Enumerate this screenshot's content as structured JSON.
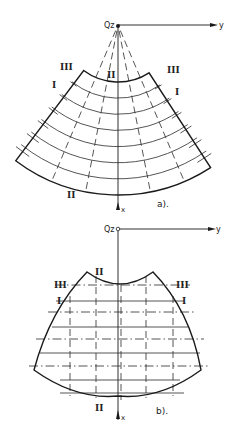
{
  "figures": [
    {
      "id": "a",
      "caption": "a).",
      "origin_label": "Qz",
      "y_axis_label": "y",
      "x_axis_label": "x",
      "section_labels": {
        "left_top": "III",
        "left_mid": "I",
        "top_center": "II",
        "right_top": "III",
        "right_mid": "I",
        "bottom": "II"
      },
      "description": "Annular sector (curved fan-shaped) cross-section with radial dashed lines converging at origin Qz and concentric arc lines"
    },
    {
      "id": "b",
      "caption": "b).",
      "origin_label": "Qz",
      "y_axis_label": "y",
      "x_axis_label": "x",
      "section_labels": {
        "left_top": "III",
        "left_mid": "I",
        "top_center": "II",
        "right_top": "III",
        "right_mid": "I",
        "bottom": "II"
      },
      "description": "Curved-sided cross-section with concave top, convex sides and bottom, overlaid with horizontal solid/dash-dot lines and vertical dashed lines"
    }
  ]
}
